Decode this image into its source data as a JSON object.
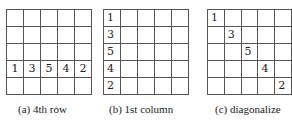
{
  "panels": [
    {
      "caption": "(a) 4th row",
      "highlight": {
        "type": "row",
        "index": 3,
        "values": [
          "1",
          "3",
          "5",
          "4",
          "2"
        ]
      }
    },
    {
      "caption": "(b) 1st column",
      "highlight": {
        "type": "column",
        "index": 0,
        "values": [
          "1",
          "3",
          "5",
          "4",
          "2"
        ]
      }
    },
    {
      "caption": "(c) diagonalize",
      "highlight": {
        "type": "diagonal",
        "values": [
          "1",
          "3",
          "5",
          "4",
          "2"
        ]
      }
    }
  ],
  "grid_size": 5
}
